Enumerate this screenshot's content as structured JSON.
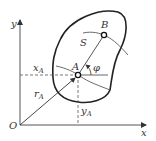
{
  "diagram": {
    "type": "rigid-body-kinematics",
    "labels": {
      "origin": "O",
      "x_axis": "x",
      "y_axis": "y",
      "point_a": "A",
      "point_b": "B",
      "arc": "S",
      "angle": "φ",
      "xa": "x",
      "xa_sub": "A",
      "ya": "y",
      "ya_sub": "A",
      "ra": "r",
      "ra_sub": "A"
    },
    "colors": {
      "stroke": "#222222",
      "axis": "#444444",
      "background": "#ffffff"
    }
  }
}
